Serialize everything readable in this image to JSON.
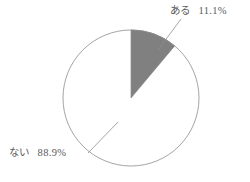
{
  "chart_data": {
    "type": "pie",
    "title": "",
    "subtitle": "",
    "xlabel": "",
    "ylabel": "",
    "legend_position": "none",
    "grid": false,
    "start_angle_deg": 0,
    "direction": "clockwise",
    "categories": [
      "ある",
      "ない"
    ],
    "values": [
      11.1,
      88.9
    ],
    "value_unit": "%",
    "slices": [
      {
        "label": "ある",
        "value": 11.1,
        "value_text": "11.1%",
        "angle_deg": 40.0,
        "color": "#808080",
        "label_position": "top-right",
        "leader_line": true
      },
      {
        "label": "ない",
        "value": 88.9,
        "value_text": "88.9%",
        "angle_deg": 320.0,
        "color": "#ffffff",
        "label_position": "bottom-left",
        "leader_line": true
      }
    ],
    "annotations": [
      {
        "name": "aru-callout",
        "text_name": "ある",
        "text_value": "11.1%"
      },
      {
        "name": "nai-callout",
        "text_name": "ない",
        "text_value": "88.9%"
      }
    ]
  },
  "style": {
    "background": "#ffffff",
    "outline_color": "#9a9a9a",
    "slice_fill_shaded": "#808080",
    "slice_fill_empty": "#ffffff",
    "leader_line_color": "#8f8f8f",
    "text_color": "#5a5a5a"
  },
  "geometry": {
    "center_x": 131,
    "center_y": 98,
    "radius": 68
  }
}
